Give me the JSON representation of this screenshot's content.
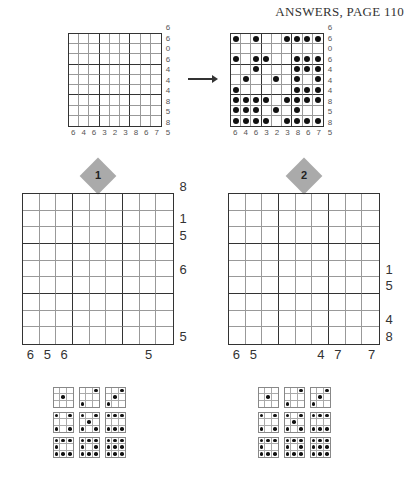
{
  "header": {
    "title": "ANSWERS, PAGE 110"
  },
  "example": {
    "empty_grid": {
      "corner_top": "6",
      "row_clues": [
        "6",
        "0",
        "6",
        "4",
        "4",
        "4",
        "8",
        "5",
        "8"
      ],
      "col_clues": [
        "6",
        "4",
        "6",
        "3",
        "2",
        "3",
        "8",
        "6",
        "7"
      ],
      "corner_bottom": "5"
    },
    "solved_grid": {
      "corner_top": "6",
      "row_clues": [
        "6",
        "0",
        "6",
        "4",
        "4",
        "4",
        "8",
        "5",
        "8"
      ],
      "col_clues": [
        "6",
        "4",
        "6",
        "3",
        "2",
        "3",
        "8",
        "6",
        "7"
      ],
      "corner_bottom": "5",
      "dots": [
        [
          1,
          0,
          1,
          0,
          0,
          1,
          1,
          1,
          1
        ],
        [
          0,
          0,
          0,
          0,
          0,
          0,
          0,
          0,
          0
        ],
        [
          1,
          0,
          1,
          1,
          0,
          0,
          1,
          1,
          1
        ],
        [
          0,
          0,
          1,
          0,
          0,
          0,
          1,
          1,
          1
        ],
        [
          0,
          1,
          0,
          0,
          1,
          0,
          1,
          0,
          1
        ],
        [
          1,
          0,
          0,
          0,
          0,
          0,
          1,
          1,
          1
        ],
        [
          1,
          1,
          1,
          1,
          0,
          1,
          1,
          1,
          1
        ],
        [
          1,
          1,
          1,
          0,
          1,
          0,
          1,
          0,
          0
        ],
        [
          1,
          1,
          1,
          1,
          0,
          1,
          1,
          1,
          1
        ]
      ]
    },
    "arrow_icon": "right-arrow"
  },
  "puzzles": [
    {
      "number": "1",
      "corner_top": "8",
      "row_clues": [
        "",
        "1",
        "5",
        "",
        "6",
        "",
        "",
        "",
        "5"
      ],
      "col_clues": [
        "6",
        "5",
        "6",
        "",
        "",
        "",
        "",
        "5",
        ""
      ]
    },
    {
      "number": "2",
      "corner_top": "",
      "row_clues": [
        "",
        "",
        "",
        "",
        "1",
        "5",
        "",
        "4",
        "8"
      ],
      "col_clues": [
        "6",
        "5",
        "",
        "",
        "",
        "4",
        "7",
        "",
        "7"
      ]
    }
  ],
  "dice_legend": [
    [
      0,
      0,
      0,
      0,
      1,
      0,
      0,
      0,
      0
    ],
    [
      0,
      0,
      1,
      0,
      0,
      0,
      1,
      0,
      0
    ],
    [
      0,
      0,
      1,
      0,
      1,
      0,
      1,
      0,
      0
    ],
    [
      1,
      0,
      1,
      0,
      0,
      0,
      1,
      0,
      1
    ],
    [
      1,
      0,
      1,
      0,
      1,
      0,
      1,
      0,
      1
    ],
    [
      1,
      1,
      1,
      0,
      0,
      0,
      1,
      1,
      1
    ],
    [
      1,
      1,
      1,
      1,
      0,
      0,
      1,
      1,
      1
    ],
    [
      1,
      1,
      1,
      1,
      0,
      1,
      1,
      1,
      1
    ],
    [
      1,
      1,
      1,
      1,
      1,
      1,
      1,
      1,
      1
    ]
  ]
}
